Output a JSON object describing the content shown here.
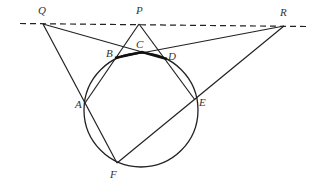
{
  "diagram": {
    "type": "geometry",
    "points": {
      "Q": {
        "label": "Q",
        "x": 43,
        "y": 24
      },
      "P": {
        "label": "P",
        "x": 139,
        "y": 24
      },
      "R": {
        "label": "R",
        "x": 284,
        "y": 26
      },
      "A": {
        "label": "A",
        "x": 85,
        "y": 103
      },
      "B": {
        "label": "B",
        "x": 115,
        "y": 58
      },
      "C": {
        "label": "C",
        "x": 142,
        "y": 52
      },
      "D": {
        "label": "D",
        "x": 167,
        "y": 59
      },
      "E": {
        "label": "E",
        "x": 195,
        "y": 100
      },
      "F": {
        "label": "F",
        "x": 117,
        "y": 163
      }
    },
    "circle": {
      "cx": 141,
      "cy": 110,
      "r": 57
    },
    "dashed_line": {
      "from": "Q",
      "through": [
        "P",
        "R"
      ],
      "style": "dashed"
    },
    "segments": [
      [
        "Q",
        "F"
      ],
      [
        "Q",
        "D"
      ],
      [
        "P",
        "A"
      ],
      [
        "P",
        "E"
      ],
      [
        "R",
        "B"
      ],
      [
        "R",
        "F"
      ]
    ],
    "thick_path": [
      "B",
      "C",
      "D"
    ],
    "colors": {
      "stroke": "#222222",
      "background": "#ffffff"
    }
  }
}
